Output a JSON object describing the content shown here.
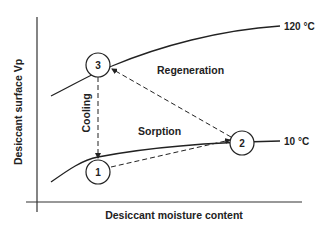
{
  "diagram": {
    "y_axis_label": "Desiccant surface Vp",
    "x_axis_label": "Desiccant moisture content",
    "isotherms": [
      {
        "label": "120 °C"
      },
      {
        "label": "10 °C"
      }
    ],
    "states": [
      {
        "id": "1"
      },
      {
        "id": "2"
      },
      {
        "id": "3"
      }
    ],
    "processes": [
      {
        "label": "Regeneration",
        "from": "2",
        "to": "3"
      },
      {
        "label": "Sorption",
        "from": "1",
        "to": "2"
      },
      {
        "label": "Cooling",
        "from": "3",
        "to": "1"
      }
    ],
    "colors": {
      "line": "#222222",
      "background": "#ffffff"
    }
  }
}
